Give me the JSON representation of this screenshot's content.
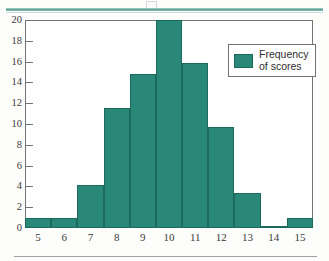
{
  "chart_data": {
    "type": "bar",
    "title": "",
    "subtitle": "",
    "xlabel": "",
    "ylabel": "",
    "categories": [
      "5",
      "6",
      "7",
      "8",
      "9",
      "10",
      "11",
      "12",
      "13",
      "14",
      "15"
    ],
    "values": [
      1,
      1,
      4.1,
      11.5,
      14.8,
      20,
      15.9,
      9.7,
      3.4,
      0.2,
      1
    ],
    "series": [
      {
        "name": "Frequency of scores",
        "values": [
          1,
          1,
          4.1,
          11.5,
          14.8,
          20,
          15.9,
          9.7,
          3.4,
          0.2,
          1
        ]
      }
    ],
    "ylim": [
      0,
      20
    ],
    "y_ticks": [
      0,
      2,
      4,
      6,
      8,
      10,
      12,
      14,
      16,
      18,
      20
    ],
    "y_tick_labels": [
      "0",
      "2",
      "4",
      "6",
      "8",
      "10",
      "12",
      "14",
      "16",
      "18",
      "20"
    ],
    "x_tick_labels": [
      "5",
      "6",
      "7",
      "8",
      "9",
      "10",
      "11",
      "12",
      "13",
      "14",
      "15"
    ],
    "grid": false,
    "legend_position": "upper-right",
    "bar_color": "#2a8878",
    "bar_edge_color": "#1c6a5d",
    "axis_color": "#6f7573"
  },
  "legend": {
    "entries": [
      {
        "swatch_color": "#2a8878",
        "line1": "Frequency",
        "line2": "of scores"
      }
    ]
  },
  "decor": {
    "rule_color": "#4e988b"
  }
}
